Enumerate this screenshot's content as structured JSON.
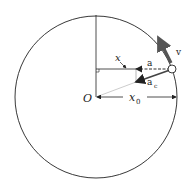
{
  "diagram": {
    "labels": {
      "origin": "O",
      "x": "x",
      "x0": "x",
      "x0_sub": "0",
      "a": "a",
      "ac": "a",
      "ac_sub": "c",
      "v": "v"
    },
    "colors": {
      "line": "#222222",
      "arrow_v": "#555555",
      "arrow_ac": "#444444",
      "thin": "#888888",
      "background": "#ffffff"
    }
  }
}
